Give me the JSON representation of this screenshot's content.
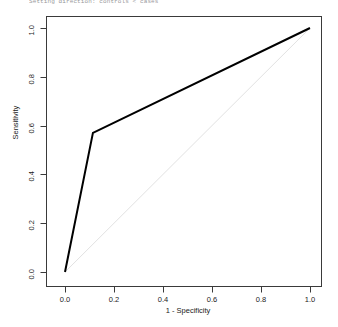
{
  "console": {
    "message": "Setting direction: controls < cases"
  },
  "chart_data": {
    "type": "line",
    "title": "",
    "subtitle": "",
    "xlabel": "1 - Specificity",
    "ylabel": "Sensitivity",
    "xlim": [
      0.0,
      1.0
    ],
    "ylim": [
      0.0,
      1.0
    ],
    "grid": false,
    "legend": "none",
    "xticks": [
      "0.0",
      "0.2",
      "0.4",
      "0.6",
      "0.8",
      "1.0"
    ],
    "xtick_values": [
      0.0,
      0.2,
      0.4,
      0.6,
      0.8,
      1.0
    ],
    "yticks": [
      "0.0",
      "0.2",
      "0.4",
      "0.6",
      "0.8",
      "1.0"
    ],
    "ytick_values": [
      0.0,
      0.2,
      0.4,
      0.6,
      0.8,
      1.0
    ],
    "series": [
      {
        "name": "ROC curve",
        "color": "#000000",
        "x": [
          0.0,
          0.114,
          1.0
        ],
        "y": [
          0.0,
          0.57,
          1.0
        ]
      },
      {
        "name": "Chance diagonal",
        "color": "#e2e2e2",
        "x": [
          0.0,
          1.0
        ],
        "y": [
          0.0,
          1.0
        ]
      }
    ]
  },
  "axes": {
    "box_color": "#3a3a3a"
  }
}
